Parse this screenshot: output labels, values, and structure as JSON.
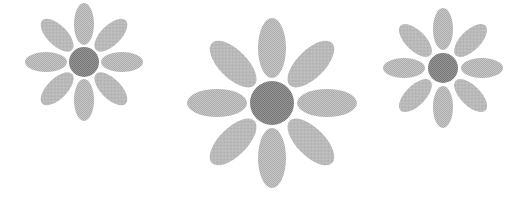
{
  "scene": {
    "width": 524,
    "height": 200,
    "background": "#ffffff",
    "colors": {
      "petal": "#bdbdbd",
      "petal_dot": "#a8a8a8",
      "center": "#8a8a8a",
      "center_dot": "#707070"
    },
    "flowers": [
      {
        "name": "small-flower-left",
        "cx": 84,
        "cy": 62,
        "center_r": 15,
        "petal_dist": 38,
        "petal_rx": 10,
        "petal_ry": 21,
        "petals": 8
      },
      {
        "name": "large-flower-middle",
        "cx": 272,
        "cy": 103,
        "center_r": 22,
        "petal_dist": 55,
        "petal_rx": 14,
        "petal_ry": 30,
        "petals": 8
      },
      {
        "name": "small-flower-right",
        "cx": 443,
        "cy": 68,
        "center_r": 15,
        "petal_dist": 39,
        "petal_rx": 10,
        "petal_ry": 21,
        "petals": 8
      }
    ]
  }
}
